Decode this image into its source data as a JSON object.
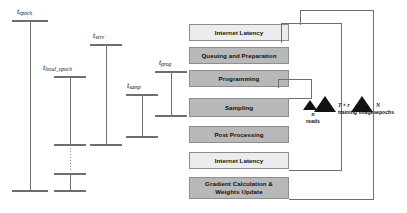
{
  "diagram": {
    "brackets": [
      {
        "id": "epoch",
        "symbol": "t",
        "subscript": "epoch",
        "label": "t_epoch"
      },
      {
        "id": "local_epoch",
        "symbol": "t",
        "subscript": "local_epoch",
        "label": "t_local_epoch"
      },
      {
        "id": "serv",
        "symbol": "t",
        "subscript": "serv",
        "label": "t_serv"
      },
      {
        "id": "samp",
        "symbol": "t",
        "subscript": "samp",
        "label": "t_samp"
      },
      {
        "id": "prog",
        "symbol": "t",
        "subscript": "prog",
        "label": "t_prog"
      }
    ],
    "stages": [
      {
        "id": "internet-latency-top",
        "label": "Internet Latency",
        "shade": "light"
      },
      {
        "id": "queuing-and-preparation",
        "label": "Queuing and Preparation",
        "shade": "dark"
      },
      {
        "id": "programming",
        "label": "Programming",
        "shade": "dark"
      },
      {
        "id": "sampling",
        "label": "Sampling",
        "shade": "dark"
      },
      {
        "id": "post-processing",
        "label": "Post Processing",
        "shade": "dark"
      },
      {
        "id": "internet-latency-bottom",
        "label": "Internet Latency",
        "shade": "light"
      },
      {
        "id": "gradient-calculation",
        "label": "Gradient Calculation & Weights Update",
        "line1": "Gradient Calculation &",
        "line2": "Weights Update",
        "shade": "dark"
      }
    ],
    "loops": [
      {
        "id": "reads",
        "count": "n",
        "unit": "reads"
      },
      {
        "id": "training-images",
        "count": "T × r",
        "unit": "training images"
      },
      {
        "id": "epochs",
        "count": "N",
        "unit": "epochs"
      }
    ],
    "colors": {
      "box_light": "#ececec",
      "box_dark": "#b8b8b8",
      "box_border": "#8e8e8e",
      "line": "#6e6e6e",
      "marker": "#111111",
      "background": "#ffffff"
    }
  }
}
